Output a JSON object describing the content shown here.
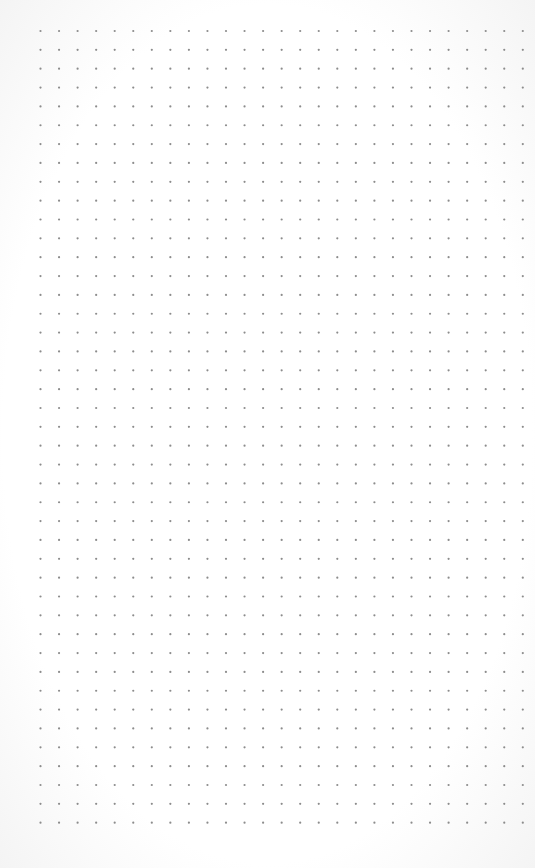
{
  "page": {
    "type": "dot-grid-paper",
    "background_color": "#ffffff",
    "dot_color": "#8c8c8c"
  },
  "grid": {
    "columns": 27,
    "rows": 43,
    "origin_x": 40.5,
    "origin_y": 31,
    "spacing_x": 18.55,
    "spacing_y": 18.85,
    "dot_radius": 1.1
  }
}
